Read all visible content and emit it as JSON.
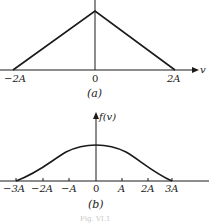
{
  "figure": {
    "caption_faint": "Fig. VI.1",
    "panel_a": {
      "label": "(a)",
      "x_axis_label": "v",
      "tick_labels": [
        "−2A",
        "0",
        "2A"
      ],
      "shape": "triangle",
      "support": [
        "-2A",
        "2A"
      ],
      "peak_at": "0"
    },
    "panel_b": {
      "label": "(b)",
      "y_axis_label": "f(v)",
      "tick_labels": [
        "−3A",
        "−2A",
        "−A",
        "0",
        "A",
        "2A",
        "3A"
      ],
      "shape": "smooth bell-shaped curve",
      "support": [
        "-3A",
        "3A"
      ],
      "peak_at": "0"
    },
    "colors": {
      "ink": "#1a1a1a",
      "background": "#ffffff"
    }
  }
}
